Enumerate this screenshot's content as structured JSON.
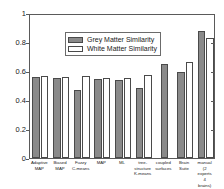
{
  "chart_data": {
    "type": "bar",
    "title": "",
    "xlabel": "",
    "ylabel": "",
    "ylim": [
      0,
      1
    ],
    "yticks": [
      0,
      0.2,
      0.4,
      0.6,
      0.8,
      1
    ],
    "ytick_labels": [
      "0",
      "0.2",
      "0.4",
      "0.6",
      "0.8",
      "1"
    ],
    "grid": false,
    "legend_position": "top-left",
    "categories": [
      "Adaptive\nMAP",
      "Biased\nMAP",
      "Fuzzy\nC-means",
      "MAP",
      "ML",
      "tree-\nstructure\nK-means",
      "coupled\nsurfaces",
      "Brain\nSuite",
      "manual\n(2 experts\n4 brains)"
    ],
    "series": [
      {
        "name": "Grey Matter Similarity",
        "color": "#8a8a8a",
        "values": [
          0.56,
          0.555,
          0.47,
          0.545,
          0.535,
          0.48,
          0.65,
          0.59,
          0.875
        ]
      },
      {
        "name": "White Matter Similarity",
        "color": "#ffffff",
        "values": [
          0.565,
          0.56,
          0.565,
          0.55,
          0.55,
          0.575,
          null,
          0.665,
          0.83
        ]
      }
    ]
  }
}
